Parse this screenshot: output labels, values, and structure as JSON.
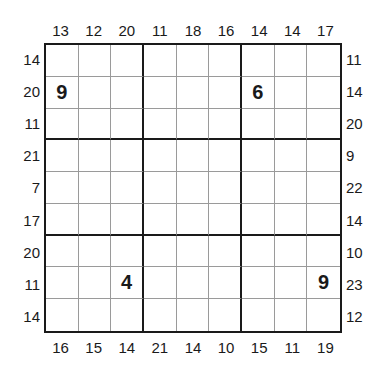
{
  "puzzle": {
    "type": "sandwich-style sudoku",
    "size": 9,
    "top_clues": [
      "13",
      "12",
      "20",
      "11",
      "18",
      "16",
      "14",
      "14",
      "17"
    ],
    "bottom_clues": [
      "16",
      "15",
      "14",
      "21",
      "14",
      "10",
      "15",
      "11",
      "19"
    ],
    "left_clues": [
      "14",
      "20",
      "11",
      "21",
      "7",
      "17",
      "20",
      "11",
      "14"
    ],
    "right_clues": [
      "11",
      "14",
      "20",
      "9",
      "22",
      "14",
      "10",
      "23",
      "12"
    ],
    "grid": [
      [
        "",
        "",
        "",
        "",
        "",
        "",
        "",
        "",
        ""
      ],
      [
        "9",
        "",
        "",
        "",
        "",
        "",
        "6",
        "",
        ""
      ],
      [
        "",
        "",
        "",
        "",
        "",
        "",
        "",
        "",
        ""
      ],
      [
        "",
        "",
        "",
        "",
        "",
        "",
        "",
        "",
        ""
      ],
      [
        "",
        "",
        "",
        "",
        "",
        "",
        "",
        "",
        ""
      ],
      [
        "",
        "",
        "",
        "",
        "",
        "",
        "",
        "",
        ""
      ],
      [
        "",
        "",
        "",
        "",
        "",
        "",
        "",
        "",
        ""
      ],
      [
        "",
        "",
        "4",
        "",
        "",
        "",
        "",
        "",
        "9"
      ],
      [
        "",
        "",
        "",
        "",
        "",
        "",
        "",
        "",
        ""
      ]
    ]
  }
}
